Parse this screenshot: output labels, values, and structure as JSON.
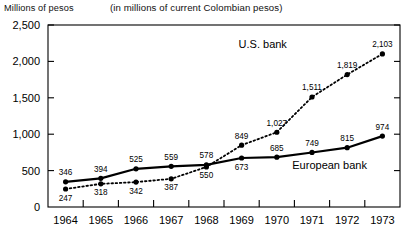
{
  "header": {
    "y_axis_title": "Millions of pesos",
    "subtitle": "(in millions of current Colombian pesos)"
  },
  "chart_data": {
    "type": "line",
    "title": "",
    "subtitle": "(in millions of current Colombian pesos)",
    "xlabel": "",
    "ylabel": "Millions of pesos",
    "x": [
      "1964",
      "1965",
      "1966",
      "1967",
      "1968",
      "1969",
      "1970",
      "1971",
      "1972",
      "1973"
    ],
    "categories": [
      "1964",
      "1965",
      "1966",
      "1967",
      "1968",
      "1969",
      "1970",
      "1971",
      "1972",
      "1973"
    ],
    "ylim": [
      0,
      2500
    ],
    "yticks": [
      0,
      500,
      1000,
      1500,
      2000,
      2500
    ],
    "ytick_labels": [
      "0",
      "500",
      "1,000",
      "1,500",
      "2,000",
      "2,500"
    ],
    "grid": false,
    "legend_position": "inline-annotation",
    "series": [
      {
        "name": "European bank",
        "style": "solid",
        "marker": "filled-circle",
        "color": "#000000",
        "values": [
          346,
          394,
          525,
          559,
          578,
          673,
          685,
          749,
          815,
          974
        ],
        "value_labels": [
          "346",
          "394",
          "525",
          "559",
          "578",
          "673",
          "685",
          "749",
          "815",
          "974"
        ],
        "label_positions": [
          "above",
          "above",
          "above",
          "above",
          "above",
          "below",
          "above",
          "above",
          "above",
          "above"
        ]
      },
      {
        "name": "U.S. bank",
        "style": "dotted",
        "marker": "filled-circle",
        "color": "#000000",
        "values": [
          247,
          318,
          342,
          387,
          550,
          849,
          1027,
          1511,
          1819,
          2103
        ],
        "value_labels": [
          "247",
          "318",
          "342",
          "387",
          "550",
          "849",
          "1,027",
          "1,511",
          "1,819",
          "2,103"
        ],
        "label_positions": [
          "below",
          "below",
          "below",
          "below",
          "below",
          "above",
          "above",
          "above",
          "above",
          "above"
        ]
      }
    ],
    "annotations": [
      {
        "text": "U.S. bank",
        "x": 1969.6,
        "y": 2180
      },
      {
        "text": "European bank",
        "x": 1971.5,
        "y": 520
      }
    ]
  }
}
